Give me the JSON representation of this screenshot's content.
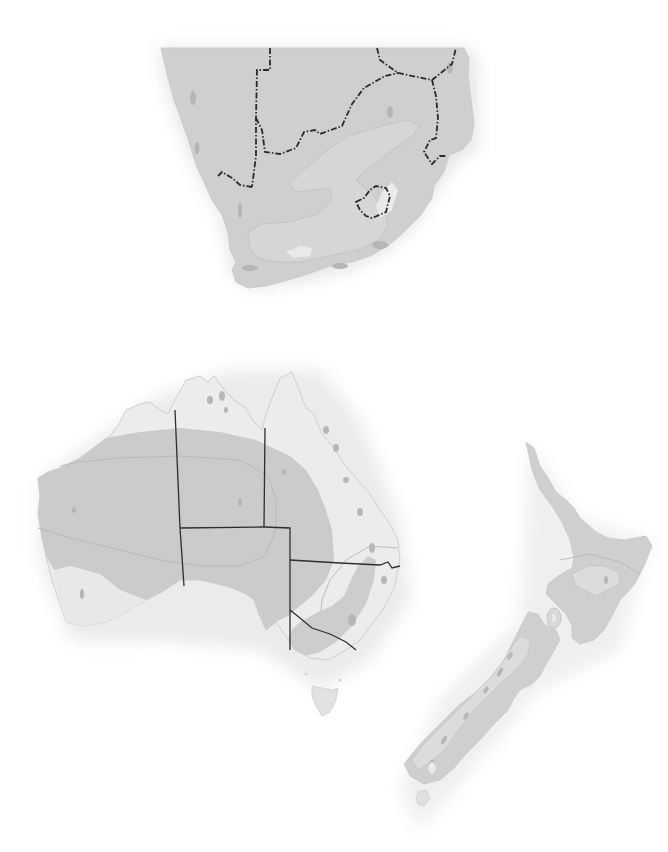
{
  "map": {
    "title": "",
    "style": "grayscale shaded relief / climate-zone map, no labels",
    "regions": [
      {
        "name": "Southern Africa",
        "features": [
          "Namibia border",
          "Botswana border",
          "Zimbabwe border",
          "Mozambique border",
          "Eswatini border",
          "Lesotho border",
          "South Africa"
        ]
      },
      {
        "name": "Australia",
        "features": [
          "Western Australia",
          "Northern Territory",
          "South Australia",
          "Queensland",
          "New South Wales",
          "Victoria",
          "Tasmania"
        ]
      },
      {
        "name": "New Zealand",
        "features": [
          "North Island",
          "South Island",
          "Stewart Island"
        ]
      }
    ],
    "colors": {
      "background": "#ffffff",
      "zone_dark": "#c4c4c4",
      "zone_mid": "#cfcfcf",
      "zone_light": "#dedede",
      "zone_pale": "#e9e9e9",
      "border": "#2a2a2a"
    }
  }
}
